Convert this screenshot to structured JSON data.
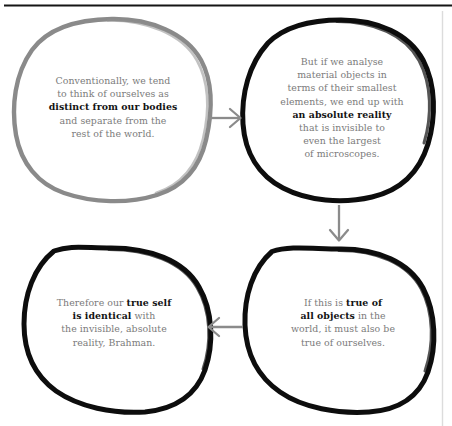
{
  "diagram": {
    "colors": {
      "node_1_stroke": "#8a8a8a",
      "node_stroke": "#0d0d0d",
      "arrow": "#8b8b8b",
      "body_text": "#7b7b7b",
      "emphasis_text": "#131313",
      "top_rule": "#151515",
      "right_rule": "#d9d9d9",
      "background": "#ffffff"
    },
    "nodes": [
      {
        "id": "node-1",
        "position": "top-left",
        "stroke_style": "hand-drawn-gray",
        "lines": [
          {
            "segments": [
              {
                "text": "Conventionally, we tend",
                "emphasis": false
              }
            ]
          },
          {
            "segments": [
              {
                "text": "to think of ourselves as",
                "emphasis": false
              }
            ]
          },
          {
            "segments": [
              {
                "text": "distinct from our bodies",
                "emphasis": true
              }
            ]
          },
          {
            "segments": [
              {
                "text": "and separate from the",
                "emphasis": false
              }
            ]
          },
          {
            "segments": [
              {
                "text": "rest of the world.",
                "emphasis": false
              }
            ]
          }
        ]
      },
      {
        "id": "node-2",
        "position": "top-right",
        "stroke_style": "hand-drawn-black",
        "lines": [
          {
            "segments": [
              {
                "text": "But if we analyse",
                "emphasis": false
              }
            ]
          },
          {
            "segments": [
              {
                "text": "material objects in",
                "emphasis": false
              }
            ]
          },
          {
            "segments": [
              {
                "text": "terms of their smallest",
                "emphasis": false
              }
            ]
          },
          {
            "segments": [
              {
                "text": "elements, we end up with",
                "emphasis": false
              }
            ]
          },
          {
            "segments": [
              {
                "text": "an absolute reality",
                "emphasis": true
              }
            ]
          },
          {
            "segments": [
              {
                "text": "that is invisible to",
                "emphasis": false
              }
            ]
          },
          {
            "segments": [
              {
                "text": "even the largest",
                "emphasis": false
              }
            ]
          },
          {
            "segments": [
              {
                "text": "of microscopes.",
                "emphasis": false
              }
            ]
          }
        ]
      },
      {
        "id": "node-3",
        "position": "bottom-right",
        "stroke_style": "hand-drawn-black",
        "lines": [
          {
            "segments": [
              {
                "text": "If this is ",
                "emphasis": false
              },
              {
                "text": "true of",
                "emphasis": true
              }
            ]
          },
          {
            "segments": [
              {
                "text": "all objects",
                "emphasis": true
              },
              {
                "text": " in the",
                "emphasis": false
              }
            ]
          },
          {
            "segments": [
              {
                "text": "world, it must also be",
                "emphasis": false
              }
            ]
          },
          {
            "segments": [
              {
                "text": "true of ourselves.",
                "emphasis": false
              }
            ]
          }
        ]
      },
      {
        "id": "node-4",
        "position": "bottom-left",
        "stroke_style": "hand-drawn-black",
        "lines": [
          {
            "segments": [
              {
                "text": "Therefore our ",
                "emphasis": false
              },
              {
                "text": "true self",
                "emphasis": true
              }
            ]
          },
          {
            "segments": [
              {
                "text": "is identical",
                "emphasis": true
              },
              {
                "text": " with",
                "emphasis": false
              }
            ]
          },
          {
            "segments": [
              {
                "text": "the invisible, absolute",
                "emphasis": false
              }
            ]
          },
          {
            "segments": [
              {
                "text": "reality, Brahman.",
                "emphasis": false
              }
            ]
          }
        ]
      }
    ],
    "arrows": [
      {
        "id": "arrow-1",
        "from": "node-1",
        "to": "node-2",
        "direction": "right"
      },
      {
        "id": "arrow-2",
        "from": "node-2",
        "to": "node-3",
        "direction": "down"
      },
      {
        "id": "arrow-3",
        "from": "node-3",
        "to": "node-4",
        "direction": "left"
      }
    ],
    "rules": [
      {
        "id": "top-rule",
        "orientation": "horizontal"
      },
      {
        "id": "right-rule",
        "orientation": "vertical"
      }
    ]
  }
}
